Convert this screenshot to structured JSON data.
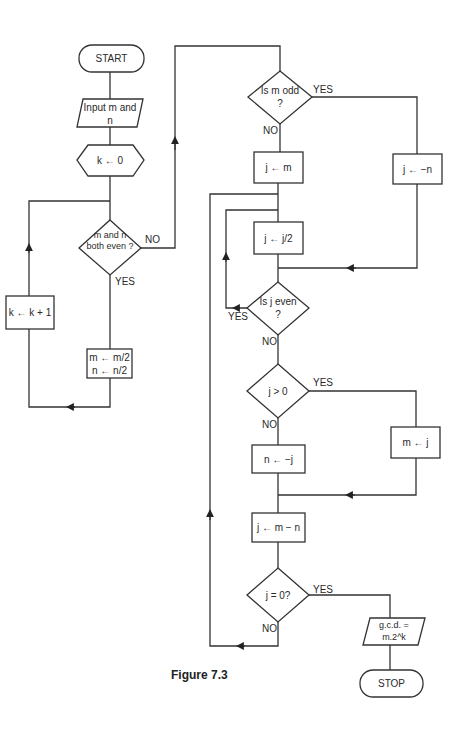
{
  "header": {
    "cropped_text": "...y g...g..."
  },
  "caption": "Figure 7.3",
  "nodes": {
    "start": "START",
    "input": "Input m and n",
    "init_k": "k ← 0",
    "both_even": "m and n both even ?",
    "inc_k": "k ← k + 1",
    "halve": "m ← m/2  n ← n/2",
    "m_odd": "Is m odd ?",
    "j_m": "j ← m",
    "j_neg_n": "j ← −n",
    "j_half": "j ← j/2",
    "j_even": "Is j even ?",
    "j_pos": "j > 0",
    "n_neg_j": "n ← −j",
    "m_j": "m ← j",
    "j_diff": "j ← m − n",
    "j_zero": "j = 0?",
    "gcd": "g.c.d. = m.2^k",
    "stop": "STOP"
  },
  "edge_labels": {
    "both_even_no": "NO",
    "both_even_yes": "YES",
    "m_odd_yes": "YES",
    "m_odd_no": "NO",
    "j_even_yes": "YES",
    "j_even_no": "NO",
    "j_pos_yes": "YES",
    "j_pos_no": "NO",
    "j_zero_yes": "YES",
    "j_zero_no": "NO"
  }
}
